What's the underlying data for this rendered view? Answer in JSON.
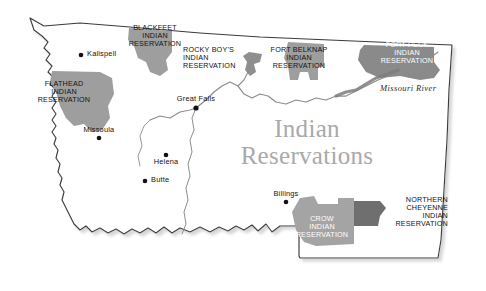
{
  "map": {
    "title": "Indian\nReservations",
    "background_color": "#ffffff",
    "outline_color": "#3a3a3a",
    "shadow_color": "#c8c8c8",
    "river_line_color": "#8d8d8d",
    "river_label": "Missouri River",
    "state_outline_name": "montana-state-outline"
  },
  "reservations": [
    {
      "id": "blackfeet",
      "name": "BLACKFEET\nINDIAN\nRESERVATION",
      "fill": "#9e9e9e",
      "text_color": "#121212",
      "label_x": 115,
      "label_y": 24,
      "label_w": 80
    },
    {
      "id": "flathead",
      "name": "FLATHEAD\nINDIAN\nRESERVATION",
      "fill": "#9e9e9e",
      "text_color": "#121212",
      "label_x": 25,
      "label_y": 80,
      "label_w": 78
    },
    {
      "id": "rocky-boys",
      "name": "ROCKY BOY'S\nINDIAN\nRESERVATION",
      "fill": "#8f8f8f",
      "text_color": "#121212",
      "label_x": 183,
      "label_y": 46,
      "label_w": 80
    },
    {
      "id": "fort-belknap",
      "name": "FORT BELKNAP\nINDIAN\nRESERVATION",
      "fill": "#9e9e9e",
      "text_color": "#121212",
      "label_x": 262,
      "label_y": 46,
      "label_w": 74
    },
    {
      "id": "fort-peck",
      "name": "FORT PECK\nINDIAN\nRESERVATION",
      "fill": "#8a8a8a",
      "text_color": "#ffffff",
      "label_x": 368,
      "label_y": 41,
      "label_w": 78
    },
    {
      "id": "crow",
      "name": "CROW\nINDIAN\nRESERVATION",
      "fill": "#a4a4a4",
      "text_color": "#ffffff",
      "label_x": 284,
      "label_y": 215,
      "label_w": 76
    },
    {
      "id": "northern-cheyenne",
      "name": "NORTHERN\nCHEYENNE\nINDIAN\nRESERVATION",
      "fill": "#6f6f6f",
      "text_color": "#121212",
      "label_x": 368,
      "label_y": 196,
      "label_w": 80
    }
  ],
  "cities": [
    {
      "id": "kalispell",
      "name": "Kalispell",
      "dot_x": 81,
      "dot_y": 55,
      "label_x": 87,
      "label_y": 50,
      "align": "left"
    },
    {
      "id": "missoula",
      "name": "Missoula",
      "dot_x": 99,
      "dot_y": 138,
      "label_x": 99,
      "label_y": 126,
      "align": "center"
    },
    {
      "id": "helena",
      "name": "Helena",
      "dot_x": 166,
      "dot_y": 155,
      "label_x": 166,
      "label_y": 158,
      "align": "center"
    },
    {
      "id": "butte",
      "name": "Butte",
      "dot_x": 145,
      "dot_y": 181,
      "label_x": 151,
      "label_y": 176,
      "align": "left"
    },
    {
      "id": "great-falls",
      "name": "Great Falls",
      "dot_x": 196,
      "dot_y": 108,
      "label_x": 196,
      "label_y": 95,
      "align": "center"
    },
    {
      "id": "billings",
      "name": "Billings",
      "dot_x": 286,
      "dot_y": 202,
      "label_x": 286,
      "label_y": 190,
      "align": "center"
    }
  ],
  "title_position": {
    "x": 232,
    "y": 116,
    "w": 150
  },
  "river_label_position": {
    "x": 380,
    "y": 84
  }
}
